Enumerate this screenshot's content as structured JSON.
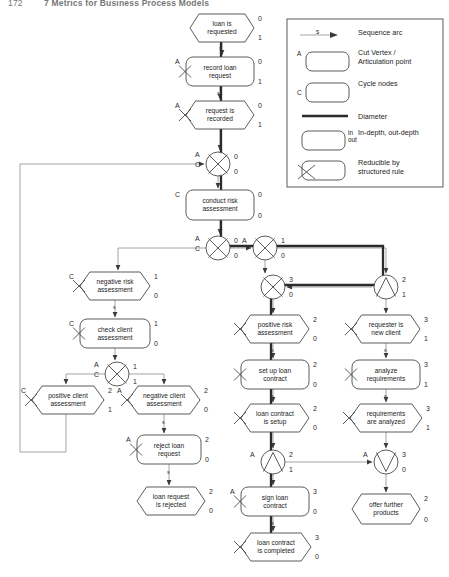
{
  "page": {
    "running_head_number": "172",
    "running_head_title": "7 Metrics for Business Process Models",
    "width": 449,
    "height": 577
  },
  "colors": {
    "stroke": "#4a4a4a",
    "thin_arc": "#9a9a9a",
    "diameter": "#2b2b2b",
    "text": "#1c1c1c",
    "legend_border": "#5a5a5a",
    "node_fill": "#ffffff"
  },
  "legend": {
    "title": "",
    "items": [
      {
        "id": "sequence-arc",
        "symbol": "arrow",
        "mark": "",
        "arc_label": "s",
        "label": "Sequence arc"
      },
      {
        "id": "cut-vertex",
        "symbol": "rounded-rect",
        "mark": "A",
        "arc_label": "",
        "label": "Cut Vertex /\nArticulation point"
      },
      {
        "id": "cycle-nodes",
        "symbol": "rounded-rect",
        "mark": "C",
        "arc_label": "",
        "label": "Cycle nodes"
      },
      {
        "id": "diameter",
        "symbol": "thick-line",
        "mark": "",
        "arc_label": "",
        "label": "Diameter"
      },
      {
        "id": "in-out-depth",
        "symbol": "rounded-rect",
        "mark": "in\nout",
        "arc_label": "",
        "label": "In-depth, out-depth"
      },
      {
        "id": "reducible",
        "symbol": "rounded-rect-x",
        "mark": "",
        "arc_label": "",
        "label": "Reducible by\nstructured rule"
      }
    ]
  },
  "graph": {
    "arc_label": "s",
    "nodes": [
      {
        "id": "loan-is-requested",
        "label": "loan is\nrequested",
        "shape": "hexagon",
        "x": 190,
        "y": 14,
        "w": 64,
        "h": 28,
        "in": "0",
        "out": "1",
        "marks": [],
        "reducible": false
      },
      {
        "id": "record-loan-request",
        "label": "record loan\nrequest",
        "shape": "rounded",
        "x": 186,
        "y": 57,
        "w": 68,
        "h": 29,
        "in": "0",
        "out": "1",
        "marks": [
          "A"
        ],
        "reducible": true
      },
      {
        "id": "request-is-recorded",
        "label": "request is\nrecorded",
        "shape": "hexagon",
        "x": 186,
        "y": 101,
        "w": 68,
        "h": 28,
        "in": "0",
        "out": "1",
        "marks": [
          "A"
        ],
        "reducible": true
      },
      {
        "id": "gateway-xor-join-1",
        "label": "",
        "shape": "xor",
        "x": 206,
        "y": 152,
        "w": 24,
        "h": 24,
        "in": "0",
        "out": "0",
        "marks": [
          "A",
          "C"
        ],
        "reducible": false
      },
      {
        "id": "conduct-risk-assessment",
        "label": "conduct risk\nassessment",
        "shape": "rounded",
        "x": 186,
        "y": 190,
        "w": 68,
        "h": 30,
        "in": "0",
        "out": "0",
        "marks": [
          "C"
        ],
        "reducible": false
      },
      {
        "id": "gateway-xor-split-1",
        "label": "",
        "shape": "xor",
        "x": 206,
        "y": 236,
        "w": 24,
        "h": 24,
        "in": "0",
        "out": "0",
        "marks": [
          "A",
          "C"
        ],
        "reducible": false
      },
      {
        "id": "gateway-xor-split-2",
        "label": "",
        "shape": "xor",
        "x": 253,
        "y": 236,
        "w": 24,
        "h": 24,
        "in": "1",
        "out": "0",
        "marks": [
          "A"
        ],
        "reducible": false
      },
      {
        "id": "gateway-xor-join-2",
        "label": "",
        "shape": "xor",
        "x": 261,
        "y": 275,
        "w": 24,
        "h": 24,
        "in": "3",
        "out": "0",
        "marks": [],
        "reducible": false
      },
      {
        "id": "gateway-and-join-1",
        "label": "",
        "shape": "and",
        "x": 374,
        "y": 275,
        "w": 24,
        "h": 24,
        "in": "2",
        "out": "1",
        "marks": [],
        "reducible": false
      },
      {
        "id": "negative-risk-assessment",
        "label": "negative risk\nassessment",
        "shape": "hexagon",
        "x": 80,
        "y": 272,
        "w": 70,
        "h": 28,
        "in": "1",
        "out": "0",
        "marks": [
          "C"
        ],
        "reducible": true
      },
      {
        "id": "check-client-assessment",
        "label": "check client\nassessment",
        "shape": "rounded",
        "x": 80,
        "y": 319,
        "w": 70,
        "h": 29,
        "in": "1",
        "out": "0",
        "marks": [
          "C"
        ],
        "reducible": true
      },
      {
        "id": "gateway-xor-split-3",
        "label": "",
        "shape": "xor",
        "x": 105,
        "y": 362,
        "w": 24,
        "h": 24,
        "in": "1",
        "out": "1",
        "marks": [
          "A",
          "C"
        ],
        "reducible": false
      },
      {
        "id": "positive-client-assessment",
        "label": "positive client\nassessment",
        "shape": "hexagon",
        "x": 32,
        "y": 386,
        "w": 72,
        "h": 28,
        "in": "2",
        "out": "1",
        "marks": [
          "C"
        ],
        "reducible": true
      },
      {
        "id": "negative-client-assessment",
        "label": "negative client\nassessment",
        "shape": "hexagon",
        "x": 128,
        "y": 386,
        "w": 72,
        "h": 28,
        "in": "2",
        "out": "0",
        "marks": [
          "A"
        ],
        "reducible": true
      },
      {
        "id": "reject-loan-request",
        "label": "reject loan\nrequest",
        "shape": "rounded",
        "x": 137,
        "y": 435,
        "w": 64,
        "h": 29,
        "in": "2",
        "out": "0",
        "marks": [
          "A"
        ],
        "reducible": true
      },
      {
        "id": "loan-request-is-rejected",
        "label": "loan request\nis rejected",
        "shape": "hexagon",
        "x": 137,
        "y": 487,
        "w": 68,
        "h": 28,
        "in": "2",
        "out": "0",
        "marks": [],
        "reducible": false
      },
      {
        "id": "positive-risk-assessment",
        "label": "positive risk\nassessment",
        "shape": "hexagon",
        "x": 241,
        "y": 315,
        "w": 68,
        "h": 28,
        "in": "2",
        "out": "0",
        "marks": [],
        "reducible": true
      },
      {
        "id": "set-up-loan-contract",
        "label": "set up loan\ncontract",
        "shape": "rounded",
        "x": 241,
        "y": 360,
        "w": 68,
        "h": 29,
        "in": "2",
        "out": "0",
        "marks": [],
        "reducible": true
      },
      {
        "id": "loan-contract-is-setup",
        "label": "loan contract\nis setup",
        "shape": "hexagon",
        "x": 241,
        "y": 404,
        "w": 68,
        "h": 28,
        "in": "2",
        "out": "0",
        "marks": [],
        "reducible": true
      },
      {
        "id": "gateway-and-split-1",
        "label": "",
        "shape": "and",
        "x": 261,
        "y": 450,
        "w": 24,
        "h": 24,
        "in": "2",
        "out": "1",
        "marks": [
          "A"
        ],
        "reducible": false
      },
      {
        "id": "sign-loan-contract",
        "label": "sign loan\ncontract",
        "shape": "rounded",
        "x": 241,
        "y": 487,
        "w": 68,
        "h": 29,
        "in": "3",
        "out": "0",
        "marks": [
          "A"
        ],
        "reducible": true
      },
      {
        "id": "loan-contract-is-completed",
        "label": "loan contract\nis completed",
        "shape": "hexagon",
        "x": 241,
        "y": 533,
        "w": 70,
        "h": 28,
        "in": "3",
        "out": "0",
        "marks": [],
        "reducible": true
      },
      {
        "id": "requester-is-new-client",
        "label": "requester is\nnew client",
        "shape": "hexagon",
        "x": 352,
        "y": 315,
        "w": 68,
        "h": 28,
        "in": "3",
        "out": "1",
        "marks": [],
        "reducible": true
      },
      {
        "id": "analyze-requirements",
        "label": "analyze\nrequirements",
        "shape": "rounded",
        "x": 352,
        "y": 360,
        "w": 68,
        "h": 29,
        "in": "3",
        "out": "1",
        "marks": [],
        "reducible": true
      },
      {
        "id": "requirements-are-analyzed",
        "label": "requirements\nare analyzed",
        "shape": "hexagon",
        "x": 350,
        "y": 404,
        "w": 72,
        "h": 28,
        "in": "3",
        "out": "1",
        "marks": [],
        "reducible": true
      },
      {
        "id": "gateway-or-join-1",
        "label": "",
        "shape": "or",
        "x": 374,
        "y": 450,
        "w": 24,
        "h": 24,
        "in": "3",
        "out": "0",
        "marks": [
          "A"
        ],
        "reducible": false
      },
      {
        "id": "offer-further-products",
        "label": "offer further\nproducts",
        "shape": "hexagon",
        "x": 352,
        "y": 494,
        "w": 68,
        "h": 30,
        "in": "2",
        "out": "0",
        "marks": [],
        "reducible": false
      }
    ]
  }
}
